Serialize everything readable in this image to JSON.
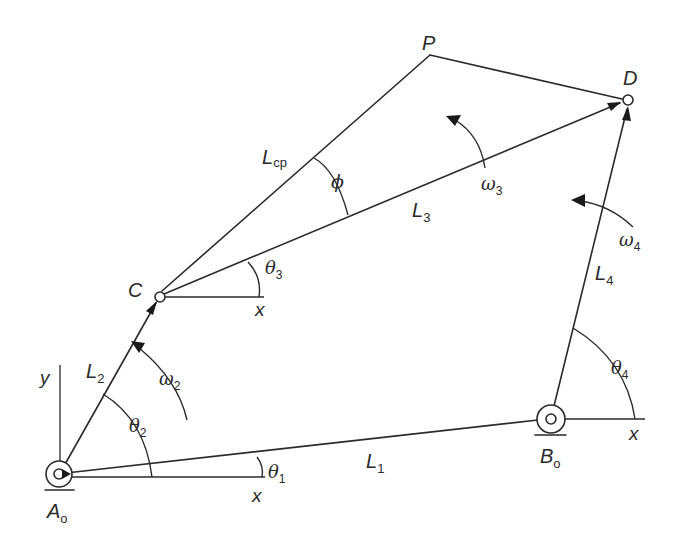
{
  "diagram": {
    "type": "four-bar linkage",
    "points": {
      "A0": {
        "label": "A",
        "sub": "o"
      },
      "B0": {
        "label": "B",
        "sub": "o"
      },
      "C": {
        "label": "C"
      },
      "D": {
        "label": "D"
      },
      "P": {
        "label": "P"
      }
    },
    "links": {
      "L1": {
        "label": "L",
        "sub": "1"
      },
      "L2": {
        "label": "L",
        "sub": "2"
      },
      "L3": {
        "label": "L",
        "sub": "3"
      },
      "L4": {
        "label": "L",
        "sub": "4"
      },
      "Lcp": {
        "label": "L",
        "sub": "cp"
      }
    },
    "angles": {
      "theta1": {
        "label": "θ",
        "sub": "1"
      },
      "theta2": {
        "label": "θ",
        "sub": "2"
      },
      "theta3": {
        "label": "θ",
        "sub": "3"
      },
      "theta4": {
        "label": "θ",
        "sub": "4"
      },
      "phi": {
        "label": "ϕ"
      }
    },
    "angular_velocities": {
      "omega2": {
        "label": "ω",
        "sub": "2"
      },
      "omega3": {
        "label": "ω",
        "sub": "3"
      },
      "omega4": {
        "label": "ω",
        "sub": "4"
      }
    },
    "axes": {
      "x_label": "x",
      "y_label": "y"
    }
  }
}
